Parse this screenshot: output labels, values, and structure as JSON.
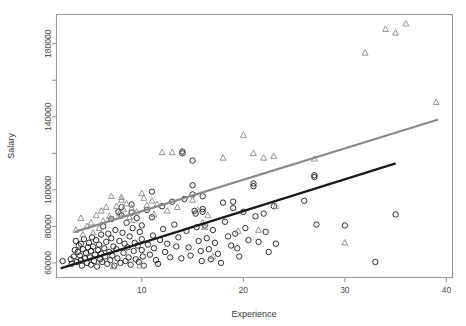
{
  "chart_data": {
    "type": "scatter",
    "title": "",
    "subtitle": "",
    "xlabel": "Experience",
    "ylabel": "Salary",
    "xlim": [
      1.6,
      40.6
    ],
    "ylim": [
      52000,
      196000
    ],
    "grid": false,
    "legend": "none",
    "xticks": [
      10,
      20,
      30,
      40
    ],
    "xtick_labels": [
      "10",
      "20",
      "30",
      "40"
    ],
    "yticks": [
      60000,
      80000,
      100000,
      120000,
      140000,
      160000,
      180000
    ],
    "ytick_labels": [
      "60000",
      "80000",
      "100000",
      "",
      "140000",
      "",
      "180000"
    ],
    "series": [
      {
        "name": "group-circles",
        "marker": "circle",
        "color": "#1a1a1a",
        "points": [
          [
            2.2,
            61000
          ],
          [
            3.0,
            62000
          ],
          [
            3.1,
            59500
          ],
          [
            3.3,
            63500
          ],
          [
            3.4,
            67000
          ],
          [
            3.5,
            72000
          ],
          [
            3.6,
            60500
          ],
          [
            3.7,
            66000
          ],
          [
            3.8,
            69500
          ],
          [
            3.9,
            64000
          ],
          [
            4.0,
            61500
          ],
          [
            4.0,
            70500
          ],
          [
            4.1,
            58500
          ],
          [
            4.2,
            67500
          ],
          [
            4.3,
            73000
          ],
          [
            4.4,
            62500
          ],
          [
            4.5,
            65500
          ],
          [
            4.6,
            60000
          ],
          [
            4.7,
            68500
          ],
          [
            4.8,
            71000
          ],
          [
            4.9,
            63000
          ],
          [
            5.0,
            59000
          ],
          [
            5.0,
            66500
          ],
          [
            5.1,
            74000
          ],
          [
            5.2,
            69000
          ],
          [
            5.3,
            61000
          ],
          [
            5.4,
            64500
          ],
          [
            5.5,
            72500
          ],
          [
            5.6,
            58000
          ],
          [
            5.7,
            67000
          ],
          [
            5.8,
            70000
          ],
          [
            5.9,
            62000
          ],
          [
            6.0,
            75500
          ],
          [
            6.0,
            65000
          ],
          [
            6.1,
            60500
          ],
          [
            6.2,
            80000
          ],
          [
            6.3,
            68000
          ],
          [
            6.4,
            63500
          ],
          [
            6.5,
            71500
          ],
          [
            6.6,
            59500
          ],
          [
            6.7,
            76000
          ],
          [
            6.8,
            66000
          ],
          [
            6.9,
            61500
          ],
          [
            7.0,
            84000
          ],
          [
            7.0,
            73500
          ],
          [
            7.1,
            64000
          ],
          [
            7.2,
            69000
          ],
          [
            7.3,
            58500
          ],
          [
            7.4,
            78000
          ],
          [
            7.5,
            67500
          ],
          [
            7.6,
            62500
          ],
          [
            7.7,
            88000
          ],
          [
            7.8,
            72000
          ],
          [
            7.9,
            60000
          ],
          [
            8.0,
            90500
          ],
          [
            8.0,
            86000
          ],
          [
            8.1,
            76500
          ],
          [
            8.2,
            65500
          ],
          [
            8.3,
            70500
          ],
          [
            8.4,
            61000
          ],
          [
            8.5,
            82000
          ],
          [
            8.6,
            68500
          ],
          [
            8.7,
            63000
          ],
          [
            8.8,
            74500
          ],
          [
            8.9,
            59000
          ],
          [
            9.0,
            92000
          ],
          [
            9.0,
            87500
          ],
          [
            9.1,
            79000
          ],
          [
            9.2,
            66500
          ],
          [
            9.3,
            71000
          ],
          [
            9.4,
            62000
          ],
          [
            9.5,
            84500
          ],
          [
            9.6,
            69500
          ],
          [
            9.7,
            60500
          ],
          [
            9.8,
            77000
          ],
          [
            10.0,
            80500
          ],
          [
            10.0,
            73000
          ],
          [
            10.0,
            67000
          ],
          [
            10.1,
            63500
          ],
          [
            10.2,
            58500
          ],
          [
            10.5,
            89000
          ],
          [
            10.6,
            70000
          ],
          [
            10.8,
            64500
          ],
          [
            11.0,
            99000
          ],
          [
            11.0,
            85000
          ],
          [
            11.1,
            75000
          ],
          [
            11.2,
            68000
          ],
          [
            11.4,
            61500
          ],
          [
            11.6,
            59500
          ],
          [
            11.8,
            72500
          ],
          [
            12.0,
            91000
          ],
          [
            12.1,
            78500
          ],
          [
            12.3,
            66000
          ],
          [
            12.5,
            70500
          ],
          [
            12.8,
            63000
          ],
          [
            13.0,
            93500
          ],
          [
            13.2,
            81000
          ],
          [
            13.4,
            69000
          ],
          [
            13.6,
            74000
          ],
          [
            13.9,
            62500
          ],
          [
            14.0,
            121000
          ],
          [
            14.0,
            120000
          ],
          [
            14.2,
            95000
          ],
          [
            14.4,
            77500
          ],
          [
            14.6,
            68500
          ],
          [
            14.8,
            64000
          ],
          [
            15.0,
            116000
          ],
          [
            15.0,
            102500
          ],
          [
            15.0,
            97500
          ],
          [
            15.2,
            88500
          ],
          [
            15.3,
            87000
          ],
          [
            15.4,
            79500
          ],
          [
            15.6,
            72000
          ],
          [
            15.8,
            66500
          ],
          [
            15.9,
            61000
          ],
          [
            16.0,
            96500
          ],
          [
            16.0,
            89500
          ],
          [
            16.0,
            88000
          ],
          [
            16.2,
            80500
          ],
          [
            16.4,
            73500
          ],
          [
            16.6,
            67500
          ],
          [
            16.8,
            62000
          ],
          [
            17.0,
            78000
          ],
          [
            17.2,
            71000
          ],
          [
            17.5,
            65000
          ],
          [
            17.8,
            60000
          ],
          [
            18.0,
            93000
          ],
          [
            18.2,
            82500
          ],
          [
            18.5,
            74500
          ],
          [
            18.8,
            69500
          ],
          [
            19.0,
            93500
          ],
          [
            19.0,
            90000
          ],
          [
            19.2,
            76000
          ],
          [
            19.4,
            68000
          ],
          [
            19.6,
            63500
          ],
          [
            20.0,
            88000
          ],
          [
            20.2,
            79000
          ],
          [
            20.5,
            72500
          ],
          [
            21.0,
            103500
          ],
          [
            21.0,
            102000
          ],
          [
            21.2,
            85500
          ],
          [
            21.5,
            71500
          ],
          [
            22.0,
            87000
          ],
          [
            22.2,
            77000
          ],
          [
            22.5,
            66000
          ],
          [
            23.0,
            91000
          ],
          [
            23.2,
            70500
          ],
          [
            26.0,
            94000
          ],
          [
            27.0,
            108000
          ],
          [
            27.0,
            107000
          ],
          [
            27.2,
            81000
          ],
          [
            30.0,
            80500
          ],
          [
            33.0,
            60500
          ],
          [
            35.0,
            86500
          ]
        ]
      },
      {
        "name": "group-triangles",
        "marker": "triangle",
        "color": "#8a8a8a",
        "points": [
          [
            3.5,
            78000
          ],
          [
            4.0,
            84500
          ],
          [
            4.2,
            75500
          ],
          [
            4.6,
            80000
          ],
          [
            5.0,
            82000
          ],
          [
            5.2,
            76500
          ],
          [
            5.5,
            86000
          ],
          [
            5.8,
            79000
          ],
          [
            6.0,
            88500
          ],
          [
            6.2,
            83000
          ],
          [
            6.5,
            90500
          ],
          [
            6.8,
            85500
          ],
          [
            7.0,
            96500
          ],
          [
            7.2,
            58000
          ],
          [
            7.5,
            91000
          ],
          [
            7.8,
            87000
          ],
          [
            8.0,
            96000
          ],
          [
            8.0,
            94500
          ],
          [
            8.2,
            89500
          ],
          [
            8.5,
            92500
          ],
          [
            8.8,
            85000
          ],
          [
            9.0,
            90000
          ],
          [
            9.2,
            83500
          ],
          [
            9.5,
            88000
          ],
          [
            9.8,
            58500
          ],
          [
            10.0,
            98000
          ],
          [
            10.2,
            95500
          ],
          [
            10.5,
            91500
          ],
          [
            11.0,
            94000
          ],
          [
            11.2,
            86500
          ],
          [
            11.5,
            92000
          ],
          [
            12.0,
            120500
          ],
          [
            12.5,
            88500
          ],
          [
            13.0,
            120500
          ],
          [
            13.5,
            90500
          ],
          [
            14.0,
            120500
          ],
          [
            15.0,
            94500
          ],
          [
            15.5,
            89000
          ],
          [
            16.0,
            82000
          ],
          [
            16.2,
            79500
          ],
          [
            16.5,
            86000
          ],
          [
            17.0,
            63500
          ],
          [
            18.0,
            117500
          ],
          [
            19.5,
            77500
          ],
          [
            20.0,
            130000
          ],
          [
            21.0,
            120000
          ],
          [
            21.5,
            78000
          ],
          [
            22.0,
            117500
          ],
          [
            23.0,
            118500
          ],
          [
            23.2,
            91000
          ],
          [
            27.0,
            117000
          ],
          [
            30.0,
            71000
          ],
          [
            32.0,
            175000
          ],
          [
            34.0,
            188000
          ],
          [
            35.0,
            186000
          ],
          [
            36.0,
            191000
          ],
          [
            39.0,
            148000
          ]
        ]
      }
    ],
    "fit_lines": [
      {
        "name": "fit-line-lower",
        "color": "#1a1a1a",
        "width": 2.2,
        "x0": 2.0,
        "y0": 57000,
        "x1": 35.0,
        "y1": 114500
      },
      {
        "name": "fit-line-upper",
        "color": "#8a8a8a",
        "width": 2.2,
        "x0": 3.4,
        "y0": 77000,
        "x1": 39.2,
        "y1": 138500
      }
    ]
  },
  "axes": {
    "x_title": "Experience",
    "y_title": "Salary"
  }
}
